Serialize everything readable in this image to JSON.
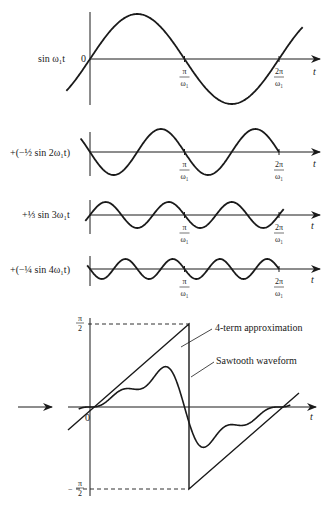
{
  "figure": {
    "panels": [
      {
        "label": "sin ω₁t",
        "coefficient": 1,
        "harmonic": 1,
        "origin_label": "0",
        "t_label": "t",
        "ticks": [
          "π/ω₁",
          "2π/ω₁"
        ]
      },
      {
        "label": "+(−½ sin 2ω₁t)",
        "coefficient": -0.5,
        "harmonic": 2,
        "t_label": "t",
        "ticks": [
          "π/ω₁",
          "2π/ω₁"
        ]
      },
      {
        "label": "+⅓ sin 3ω₁t",
        "coefficient": 0.3333,
        "harmonic": 3,
        "t_label": "t",
        "ticks": [
          "π/ω₁",
          "2π/ω₁"
        ]
      },
      {
        "label": "+(−¼ sin 4ω₁t)",
        "coefficient": -0.25,
        "harmonic": 4,
        "t_label": "t",
        "ticks": [
          "π/ω₁",
          "2π/ω₁"
        ]
      }
    ],
    "sum_panel": {
      "y_top_label": "π/2",
      "y_bottom_label": "−π/2",
      "origin_label": "0",
      "t_label": "t",
      "annotations": [
        "4-term approximation",
        "Sawtooth waveform"
      ]
    },
    "tick_numerators": {
      "pi": "π",
      "two_pi": "2π"
    },
    "tick_denominator": "ω₁",
    "frac": {
      "pi": "π",
      "two": "2"
    },
    "colors": {
      "ink": "#1a1a1a",
      "background": "#ffffff"
    }
  },
  "chart_data": {
    "type": "line",
    "xlabel": "t",
    "x_ticks": [
      "0",
      "π/ω₁",
      "2π/ω₁"
    ],
    "series": [
      {
        "name": "sin ω₁t",
        "amplitude": 1,
        "harmonic": 1
      },
      {
        "name": "−½ sin 2ω₁t",
        "amplitude": -0.5,
        "harmonic": 2
      },
      {
        "name": "⅓ sin 3ω₁t",
        "amplitude": 0.3333,
        "harmonic": 3
      },
      {
        "name": "−¼ sin 4ω₁t",
        "amplitude": -0.25,
        "harmonic": 4
      },
      {
        "name": "4-term approximation",
        "formula": "sin ω₁t − ½ sin 2ω₁t + ⅓ sin 3ω₁t − ¼ sin 4ω₁t"
      },
      {
        "name": "Sawtooth waveform",
        "range": [
          "−π/2",
          "π/2"
        ]
      }
    ],
    "ylim_sum": [
      "−π/2",
      "π/2"
    ]
  }
}
